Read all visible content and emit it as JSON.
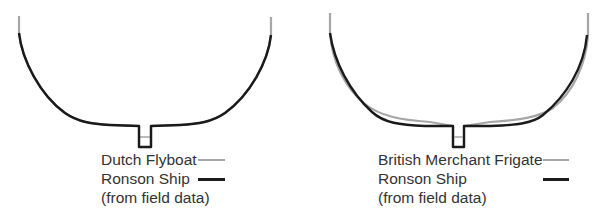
{
  "colors": {
    "comparison_line": "#a6a6a6",
    "ronson_line": "#1a1a1a",
    "text": "#333333",
    "background": "#ffffff"
  },
  "diagrams": [
    {
      "id": "left",
      "legend": {
        "comparison_label": "Dutch Flyboat",
        "ronson_label": "Ronson Ship",
        "ronson_note": "(from field data)"
      }
    },
    {
      "id": "right",
      "legend": {
        "comparison_label": "British Merchant Frigate",
        "ronson_label": "Ronson Ship",
        "ronson_note": "(from field data)"
      }
    }
  ]
}
